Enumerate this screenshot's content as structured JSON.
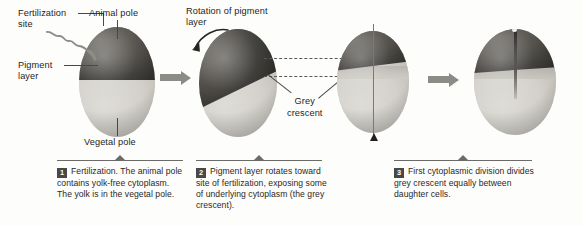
{
  "figure": {
    "type": "biology-process-diagram",
    "stages": 4
  },
  "labels": {
    "fertilization_site": "Fertilization\nsite",
    "animal_pole": "Animal pole",
    "pigment_layer": "Pigment\nlayer",
    "vegetal_pole": "Vegetal pole",
    "rotation_of_pigment_layer": "Rotation of pigment\nlayer",
    "grey_crescent": "Grey\ncrescent"
  },
  "captions": [
    {
      "number": "1",
      "text": "Fertilization. The animal pole contains yolk-free cytoplasm. The yolk is in the vegetal pole."
    },
    {
      "number": "2",
      "text": "Pigment layer rotates toward site of fertilization, exposing some of underlying cytoplasm (the grey crescent)."
    },
    {
      "number": "3",
      "text": "First cytoplasmic division divides grey crescent equally between daughter cells."
    }
  ],
  "icons": {
    "stage_arrow": "right-arrow-icon",
    "rotation_arrow": "curved-rotation-arrow-icon",
    "axis_arrow": "up-arrow-icon",
    "sperm": "sperm-squiggle-icon"
  },
  "colors": {
    "pigment_dark": "#3a3834",
    "vegetal_light": "#d2d0c9",
    "grey_crescent": "#bdbab2",
    "arrow_grey": "#8d8b86",
    "leader_line": "#4a4845",
    "caption_rule": "#6d6b67",
    "badge_background": "#4a4845",
    "background": "#fdfdfc"
  }
}
